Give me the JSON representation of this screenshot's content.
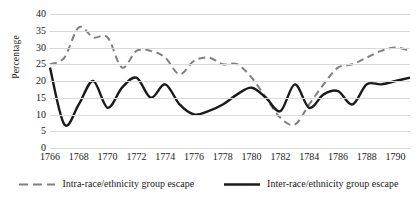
{
  "chart_data": {
    "type": "line",
    "title": "",
    "xlabel": "",
    "ylabel": "Percentage",
    "xlim": [
      1766,
      1791
    ],
    "ylim": [
      0,
      40
    ],
    "yticks": [
      0,
      5,
      10,
      15,
      20,
      25,
      30,
      35,
      40
    ],
    "xticks": [
      1766,
      1768,
      1770,
      1772,
      1774,
      1776,
      1778,
      1780,
      1782,
      1784,
      1786,
      1788,
      1790
    ],
    "grid": true,
    "legend_position": "bottom",
    "x": [
      1766,
      1767,
      1768,
      1769,
      1770,
      1771,
      1772,
      1773,
      1774,
      1775,
      1776,
      1777,
      1778,
      1779,
      1780,
      1781,
      1782,
      1783,
      1784,
      1785,
      1786,
      1787,
      1788,
      1789,
      1790,
      1791
    ],
    "series": [
      {
        "name": "Intra-race/ethnicity group escape",
        "style": "dashed",
        "color": "#808080",
        "values": [
          25,
          27,
          36,
          33,
          33,
          24,
          29,
          29,
          27,
          22,
          26,
          27,
          25,
          25,
          21,
          15,
          9,
          7,
          13,
          19,
          24,
          25,
          27,
          29,
          30,
          29
        ]
      },
      {
        "name": "Inter-race/ethnicity group escape",
        "style": "solid",
        "color": "#1a1a1a",
        "values": [
          24,
          7,
          13,
          20,
          12,
          18,
          21,
          15,
          19,
          13,
          10,
          11,
          13,
          16,
          18,
          15,
          11,
          19,
          12,
          16,
          17,
          13,
          19,
          19,
          20,
          21
        ]
      }
    ]
  },
  "legend": {
    "items": [
      {
        "label": "Intra-race/ethnicity group escape",
        "marker": "dashed-line-swatch"
      },
      {
        "label": "Inter-race/ethnicity group escape",
        "marker": "solid-line-swatch"
      }
    ]
  }
}
